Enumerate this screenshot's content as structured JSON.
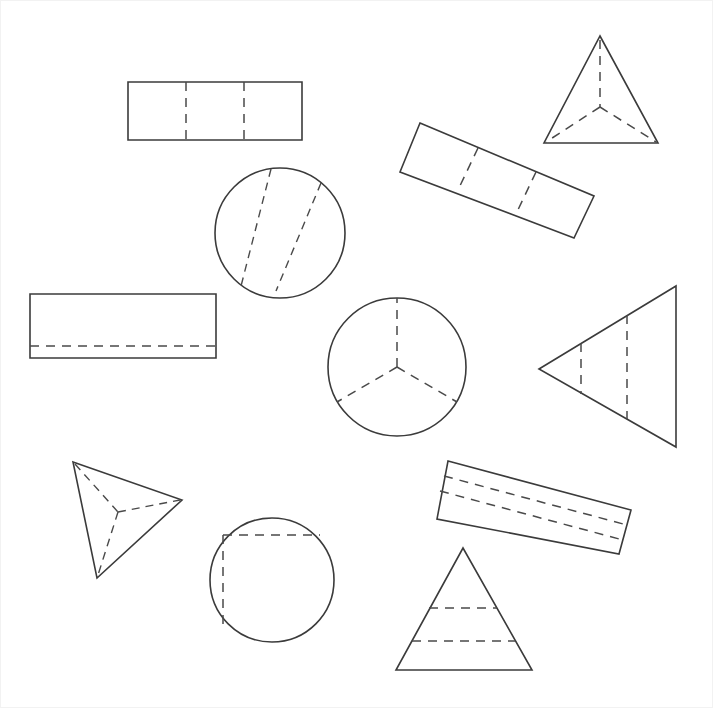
{
  "page": {
    "background_color": "#ffffff",
    "stroke_color": "#3b3b3b",
    "dash_color": "#4a4a4a",
    "width": 713,
    "height": 708,
    "frame_color": "#f2f2f2"
  },
  "shapes": [
    {
      "id": "shape-1",
      "name": "horizontal-rectangle-two-vertical-dashes",
      "label": "Rectangle with two vertical dashed cross sections",
      "type": "rectangle",
      "outline": "128,82 302,82 302,140 128,140",
      "dashes": [
        "186,82 186,140",
        "244,82 244,140"
      ]
    },
    {
      "id": "shape-2",
      "name": "tetrahedron-upright",
      "label": "Upright tetrahedron with hidden edges",
      "type": "tetrahedron",
      "outline": "600,36 658,143 544,143",
      "dashes": [
        "600,36 600,107",
        "600,107 544,143",
        "600,107 658,143"
      ]
    },
    {
      "id": "shape-3",
      "name": "tilted-rectangle-two-dashes",
      "label": "Tilted rectangle with two dashed cross sections",
      "type": "rectangle",
      "outline": "420,123 594,196 574,238 400,172",
      "dashes": [
        "478,148 458,190",
        "536,172 516,214"
      ]
    },
    {
      "id": "shape-4",
      "name": "circle-two-parallel-chords",
      "label": "Circle with two parallel dashed chords",
      "type": "circle",
      "center": "280,233",
      "radius": 65,
      "dashes": [
        "272,170 241,291",
        "321,183 276,290"
      ]
    },
    {
      "id": "shape-5",
      "name": "rectangle-single-horizontal-dash",
      "label": "Rectangle with one horizontal dashed cross section",
      "type": "rectangle",
      "outline": "30,294 216,294 216,358 30,358",
      "dashes": [
        "30,346 216,346"
      ]
    },
    {
      "id": "shape-6",
      "name": "circle-three-radii",
      "label": "Circle with three dashed radii",
      "type": "circle",
      "center": "397,367",
      "radius": 69,
      "dashes": [
        "397,367 397,298",
        "397,367 337,402",
        "397,367 457,402"
      ]
    },
    {
      "id": "shape-7",
      "name": "left-pointing-triangle-two-dashes",
      "label": "Left pointing triangle with two vertical dashed cross sections",
      "type": "triangle",
      "outline": "539,369 676,286 676,447",
      "dashes": [
        "581,343 581,395",
        "627,315 627,419"
      ]
    },
    {
      "id": "shape-8",
      "name": "tetrahedron-rotated",
      "label": "Rotated tetrahedron with hidden edges",
      "type": "tetrahedron",
      "outline": "73,462 182,500 97,578",
      "dashes": [
        "73,462 118,512",
        "118,512 182,500",
        "118,512 97,578"
      ]
    },
    {
      "id": "shape-9",
      "name": "circle-chord-and-vertical-chord",
      "label": "Circle with a horizontal dashed chord and a vertical dashed chord",
      "type": "circle",
      "center": "272,580",
      "radius": 62,
      "dashes": [
        "223,535 320,535",
        "223,535 223,625"
      ]
    },
    {
      "id": "shape-10",
      "name": "tilted-rectangle-two-long-dashes",
      "label": "Tilted rectangle with two long dashed cross sections",
      "type": "rectangle",
      "outline": "448,461 631,510 619,554 437,519",
      "dashes": [
        "444,476 627,525",
        "440,491 623,540"
      ]
    },
    {
      "id": "shape-11",
      "name": "upright-triangle-two-horizontal-dashes",
      "label": "Upright triangle with two horizontal dashed cross sections",
      "type": "triangle",
      "outline": "463,548 532,670 396,670",
      "dashes": [
        "429,608 497,608",
        "412,641 515,641"
      ]
    }
  ]
}
